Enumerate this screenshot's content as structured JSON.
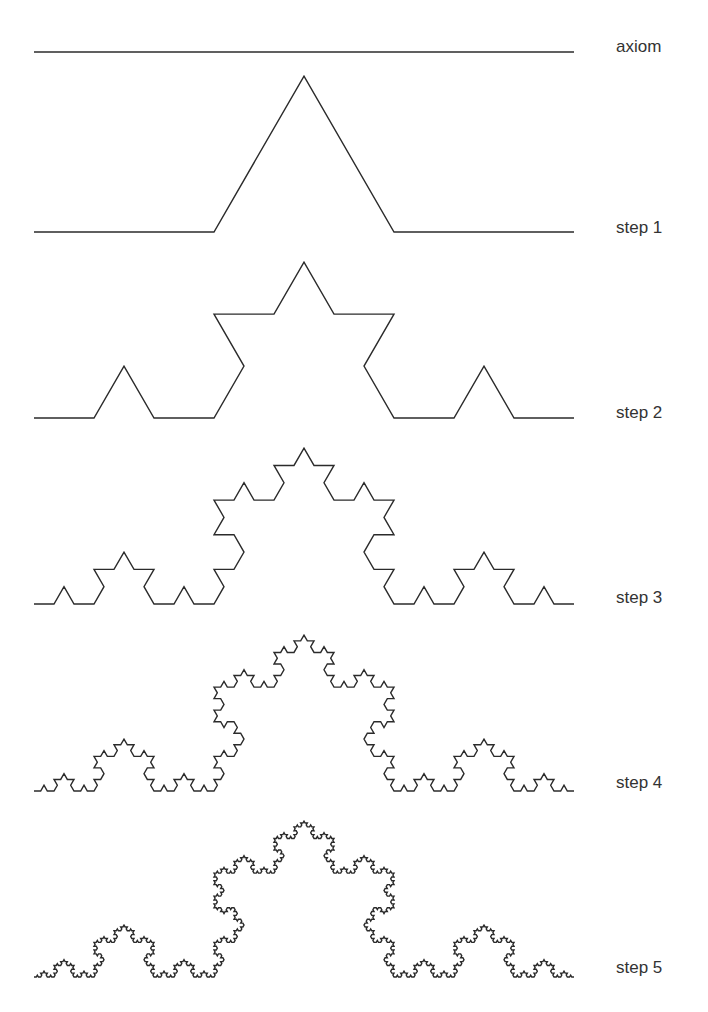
{
  "diagram": {
    "width": 708,
    "height": 1012,
    "curve_x_start": 34,
    "curve_x_end": 574,
    "label_x": 616,
    "stroke_color": "#2b2b2b",
    "label_color": "#333333",
    "rows": [
      {
        "label": "axiom",
        "iterations": 0,
        "baseline_y": 52,
        "label_baseline_y": 52
      },
      {
        "label": "step 1",
        "iterations": 1,
        "baseline_y": 232,
        "label_baseline_y": 233
      },
      {
        "label": "step 2",
        "iterations": 2,
        "baseline_y": 418,
        "label_baseline_y": 418
      },
      {
        "label": "step 3",
        "iterations": 3,
        "baseline_y": 604,
        "label_baseline_y": 603
      },
      {
        "label": "step 4",
        "iterations": 4,
        "baseline_y": 791,
        "label_baseline_y": 788
      },
      {
        "label": "step 5",
        "iterations": 5,
        "baseline_y": 977,
        "label_baseline_y": 973
      }
    ]
  }
}
